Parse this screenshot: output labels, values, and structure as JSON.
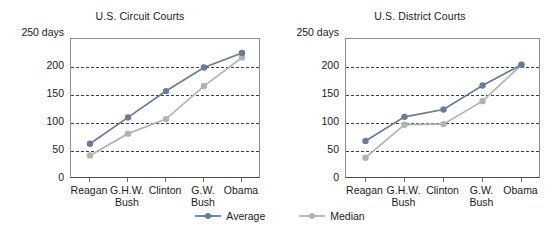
{
  "figure": {
    "width": 560,
    "height": 238,
    "background": "#ffffff"
  },
  "legend": {
    "position": "bottom-center",
    "items": [
      {
        "label": "Average",
        "color": "#6b7a99",
        "marker": "circle"
      },
      {
        "label": "Median",
        "color": "#b3b3b3",
        "marker": "circle"
      }
    ]
  },
  "colors": {
    "average": "#6b7a99",
    "median": "#b3b3b3",
    "axis": "#8c8c8c",
    "grid": "#3c3c3c",
    "text": "#1a1a1a"
  },
  "chart_data": [
    {
      "type": "line",
      "title": "U.S. Circuit Courts",
      "xlabel": "",
      "ylabel": "250 days",
      "y_unit_label": "250 days",
      "ylim": [
        0,
        250
      ],
      "yticks": [
        200,
        150,
        100,
        50,
        0
      ],
      "ytick_labels": [
        "200",
        "150",
        "100",
        "50",
        "0"
      ],
      "grid": true,
      "grid_values": [
        200,
        150,
        100,
        50
      ],
      "categories": [
        "Reagan",
        "G.H.W. Bush",
        "Clinton",
        "G.W. Bush",
        "Obama"
      ],
      "category_lines": [
        [
          "Reagan",
          ""
        ],
        [
          "G.H.W.",
          "Bush"
        ],
        [
          "Clinton",
          ""
        ],
        [
          "G.W.",
          "Bush"
        ],
        [
          "Obama",
          ""
        ]
      ],
      "series": [
        {
          "name": "Average",
          "color": "#6b7a99",
          "values": [
            63,
            110,
            157,
            199,
            225
          ]
        },
        {
          "name": "Median",
          "color": "#b3b3b3",
          "values": [
            42,
            81,
            107,
            166,
            217
          ]
        }
      ]
    },
    {
      "type": "line",
      "title": "U.S. District Courts",
      "xlabel": "",
      "ylabel": "250 days",
      "y_unit_label": "250 days",
      "ylim": [
        0,
        250
      ],
      "yticks": [
        200,
        150,
        100,
        50,
        0
      ],
      "ytick_labels": [
        "200",
        "150",
        "100",
        "50",
        "0"
      ],
      "grid": true,
      "grid_values": [
        200,
        150,
        100,
        50
      ],
      "categories": [
        "Reagan",
        "G.H.W. Bush",
        "Clinton",
        "G.W. Bush",
        "Obama"
      ],
      "category_lines": [
        [
          "Reagan",
          ""
        ],
        [
          "G.H.W.",
          "Bush"
        ],
        [
          "Clinton",
          ""
        ],
        [
          "G.W.",
          "Bush"
        ],
        [
          "Obama",
          ""
        ]
      ],
      "series": [
        {
          "name": "Average",
          "color": "#6b7a99",
          "values": [
            68,
            111,
            124,
            167,
            204
          ]
        },
        {
          "name": "Median",
          "color": "#b3b3b3",
          "values": [
            38,
            97,
            98,
            139,
            204
          ]
        }
      ]
    }
  ]
}
